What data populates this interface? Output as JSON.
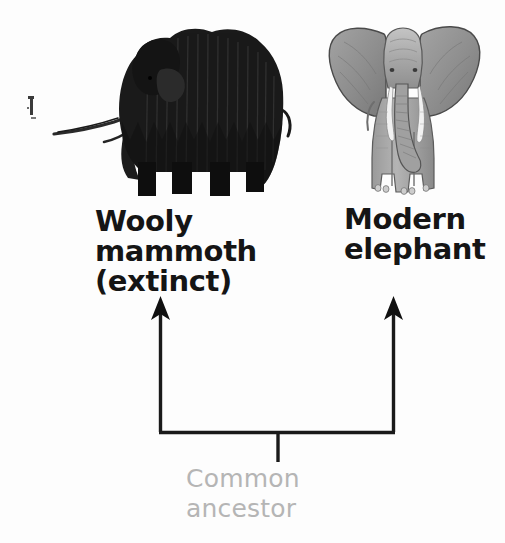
{
  "diagram": {
    "background_color": "#fdfdfd",
    "nodes": [
      {
        "id": "wooly-mammoth",
        "label": "Wooly\nmammoth\n(extinct)",
        "label_lines": [
          "Wooly",
          "mammoth",
          "(extinct)"
        ],
        "image": "mammoth-silhouette",
        "color": "#151515",
        "status": "extinct"
      },
      {
        "id": "modern-elephant",
        "label": "Modern\nelephant",
        "label_lines": [
          "Modern",
          "elephant"
        ],
        "image": "elephant-photo",
        "color": "#151515",
        "status": "living"
      }
    ],
    "root": {
      "id": "common-ancestor",
      "label": "Common\nancestor",
      "label_lines": [
        "Common",
        "ancestor"
      ],
      "color": "#b5b5b5"
    },
    "connector": {
      "type": "bracket-with-arrows",
      "stroke_color": "#1a1a1a",
      "arrow_direction": "up",
      "arrow_count": 2
    },
    "artifact": {
      "name": "scan-artifact-mark",
      "color": "#3a3a3a"
    }
  }
}
